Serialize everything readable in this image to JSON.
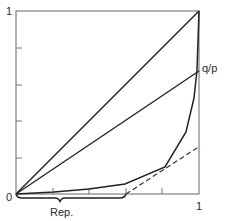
{
  "figure": {
    "y_axis": {
      "max_label": "1",
      "origin_label": "0",
      "ticks": 4
    },
    "x_axis": {
      "max_label": "1",
      "ticks": 4
    },
    "labels": {
      "line_label": "q/p",
      "brace_label": "Rep."
    },
    "colors": {
      "ink": "#222222",
      "axis": "#555555",
      "background": "#ffffff"
    },
    "elements": [
      {
        "name": "diagonal-line",
        "description": "straight line from origin to (1,1)"
      },
      {
        "name": "q-over-p-line",
        "description": "straight line from origin to (1, ~0.67)"
      },
      {
        "name": "convex-curve",
        "description": "piecewise convex curve from origin to (1,1)"
      },
      {
        "name": "dashed-tangent",
        "description": "dashed line from (~0.6,0) rising to the right"
      },
      {
        "name": "rep-brace",
        "description": "horizontal brace under x-axis from 0 to ~0.6"
      }
    ]
  }
}
